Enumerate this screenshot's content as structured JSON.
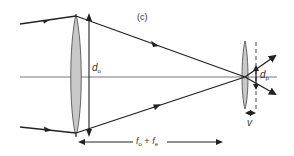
{
  "figure": {
    "panel_label": "(c)",
    "labels": {
      "objective_diameter": {
        "symbol": "d",
        "subscript": "o"
      },
      "exit_pupil_diameter": {
        "symbol": "d",
        "subscript": "p"
      },
      "eye_relief": {
        "symbol": "v"
      },
      "lens_separation": {
        "f1": "f",
        "sub1": "o",
        "plus": " + ",
        "f2": "f",
        "sub2": "e"
      }
    },
    "colors": {
      "line": "#222222",
      "lens_fill": "#c8c8c8",
      "lens_stroke": "#444444",
      "axis": "#555555"
    }
  }
}
